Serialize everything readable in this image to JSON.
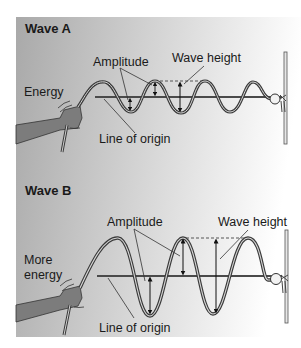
{
  "colors": {
    "panel_left": "#a9a9a9",
    "panel_right": "#ffffff",
    "rope": "#3a3a3a",
    "rope_inner": "#d8d8d8",
    "line": "#444444",
    "arm": "#7c7c7c",
    "text": "#1a1a1a"
  },
  "wave_a": {
    "title": "Wave A",
    "energy_label": "Energy",
    "amplitude_label": "Amplitude",
    "wave_height_label": "Wave height",
    "origin_label": "Line of origin"
  },
  "wave_b": {
    "title": "Wave B",
    "energy_label_line1": "More",
    "energy_label_line2": "energy",
    "amplitude_label": "Amplitude",
    "wave_height_label": "Wave height",
    "origin_label": "Line of origin"
  }
}
